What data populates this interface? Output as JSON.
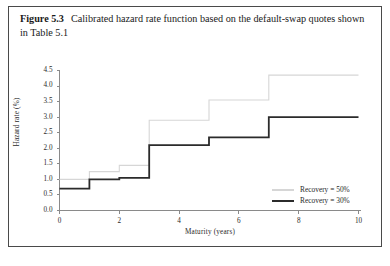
{
  "caption": {
    "figure_label": "Figure 5.3",
    "text": "Calibrated hazard rate function based on the default-swap quotes shown in Table 5.1"
  },
  "chart_data": {
    "type": "line",
    "subtype": "step",
    "title": "",
    "xlabel": "Maturity (years)",
    "ylabel": "Hazard rate (%)",
    "xlim": [
      0,
      10
    ],
    "ylim": [
      0,
      4.5
    ],
    "xticks": [
      0,
      2,
      4,
      6,
      8,
      10
    ],
    "xtick_labels": [
      "0",
      "2",
      "4",
      "6",
      "8",
      "10"
    ],
    "yticks": [
      0.0,
      0.5,
      1.0,
      1.5,
      2.0,
      2.5,
      3.0,
      3.5,
      4.0,
      4.5
    ],
    "ytick_labels": [
      "0.0",
      "0.5",
      "1.0",
      "1.5",
      "2.0",
      "2.5",
      "3.0",
      "3.5",
      "4.0",
      "4.5"
    ],
    "grid": false,
    "legend_position": "lower-right",
    "step_breakpoints": [
      0,
      1,
      2,
      3,
      5,
      7,
      10
    ],
    "series": [
      {
        "name": "Recovery = 50%",
        "color": "#d6d6d6",
        "linewidth": 1.1,
        "x": [
          0,
          1,
          2,
          3,
          5,
          7,
          10
        ],
        "values": [
          1.0,
          1.25,
          1.45,
          2.9,
          3.55,
          4.35,
          4.35
        ]
      },
      {
        "name": "Recovery = 30%",
        "color": "#2b2b2b",
        "linewidth": 1.8,
        "x": [
          0,
          1,
          2,
          3,
          5,
          7,
          10
        ],
        "values": [
          0.7,
          1.0,
          1.05,
          2.1,
          2.35,
          3.0,
          3.0
        ]
      }
    ]
  },
  "legend": {
    "items": [
      {
        "label": "Recovery = 50%",
        "color": "#d6d6d6"
      },
      {
        "label": "Recovery = 30%",
        "color": "#2b2b2b"
      }
    ]
  },
  "axes": {
    "axis_color": "#8a8a8a"
  }
}
